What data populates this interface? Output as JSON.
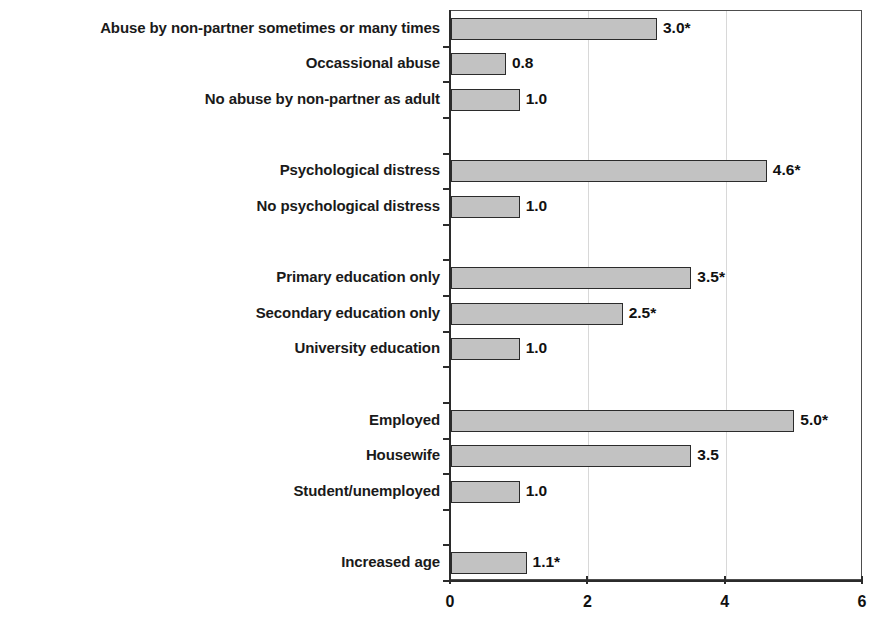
{
  "chart_data": {
    "type": "bar",
    "orientation": "horizontal",
    "title": "",
    "subtitle": "",
    "xlabel": "",
    "ylabel": "",
    "xlim": [
      0,
      6
    ],
    "xticks": [
      0,
      2,
      4,
      6
    ],
    "xtick_labels": [
      "0",
      "2",
      "4",
      "6"
    ],
    "grid": "vertical-faint",
    "legend": "none",
    "bar_fill_color": "#c2c2c2",
    "bar_border_color": "#2b2b2b",
    "axis_color": "#2b2b2b",
    "categories": [
      "Abuse by non-partner sometimes or many times",
      "Occassional abuse",
      "No abuse by non-partner as adult",
      "",
      "Psychological distress",
      "No psychological distress",
      "",
      "Primary education only",
      "Secondary education only",
      "University education",
      "",
      "Employed",
      "Housewife",
      "Student/unemployed",
      "",
      "Increased age"
    ],
    "values": [
      3.0,
      0.8,
      1.0,
      null,
      4.6,
      1.0,
      null,
      3.5,
      2.5,
      1.0,
      null,
      5.0,
      3.5,
      1.0,
      null,
      1.1
    ],
    "value_labels": [
      "3.0*",
      "0.8",
      "1.0",
      "",
      "4.6*",
      "1.0",
      "",
      "3.5*",
      "2.5*",
      "1.0",
      "",
      "5.0*",
      "3.5",
      "1.0",
      "",
      "1.1*"
    ],
    "significant": [
      true,
      false,
      false,
      false,
      true,
      false,
      false,
      true,
      true,
      false,
      false,
      true,
      false,
      false,
      false,
      true
    ],
    "rows": [
      {
        "label": "Abuse by non-partner sometimes or many times",
        "value": 3.0,
        "value_label": "3.0*",
        "significant": true
      },
      {
        "label": "Occassional abuse",
        "value": 0.8,
        "value_label": "0.8",
        "significant": false
      },
      {
        "label": "No abuse by non-partner as adult",
        "value": 1.0,
        "value_label": "1.0",
        "significant": false
      },
      {
        "label": "",
        "value": null,
        "value_label": "",
        "significant": false
      },
      {
        "label": "Psychological distress",
        "value": 4.6,
        "value_label": "4.6*",
        "significant": true
      },
      {
        "label": "No psychological distress",
        "value": 1.0,
        "value_label": "1.0",
        "significant": false
      },
      {
        "label": "",
        "value": null,
        "value_label": "",
        "significant": false
      },
      {
        "label": "Primary education only",
        "value": 3.5,
        "value_label": "3.5*",
        "significant": true
      },
      {
        "label": "Secondary education only",
        "value": 2.5,
        "value_label": "2.5*",
        "significant": true
      },
      {
        "label": "University education",
        "value": 1.0,
        "value_label": "1.0",
        "significant": false
      },
      {
        "label": "",
        "value": null,
        "value_label": "",
        "significant": false
      },
      {
        "label": "Employed",
        "value": 5.0,
        "value_label": "5.0*",
        "significant": true
      },
      {
        "label": "Housewife",
        "value": 3.5,
        "value_label": "3.5",
        "significant": false
      },
      {
        "label": "Student/unemployed",
        "value": 1.0,
        "value_label": "1.0",
        "significant": false
      },
      {
        "label": "",
        "value": null,
        "value_label": "",
        "significant": false
      },
      {
        "label": "Increased age",
        "value": 1.1,
        "value_label": "1.1*",
        "significant": true
      }
    ]
  },
  "layout": {
    "plot_left": 450,
    "plot_right": 862,
    "plot_top": 10,
    "plot_bottom": 580,
    "label_right_edge": 440,
    "row_count": 16,
    "bar_height": 22,
    "value_label_gap": 7
  }
}
